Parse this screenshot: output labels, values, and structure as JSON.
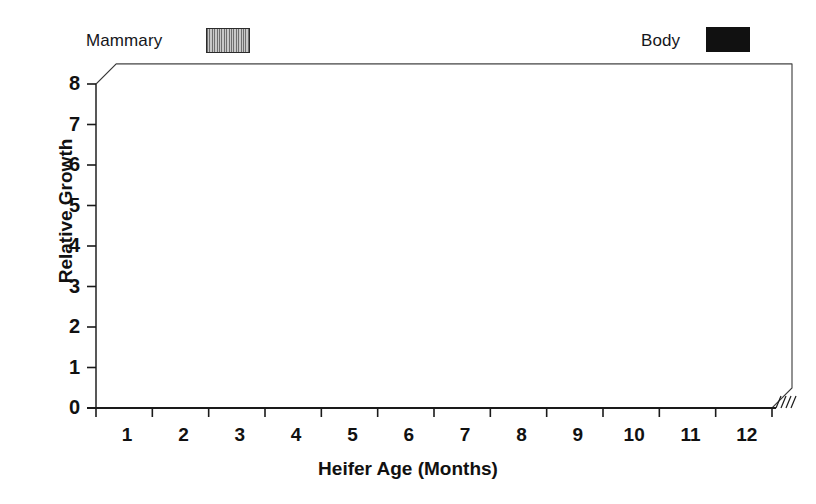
{
  "legend": {
    "items": [
      {
        "label": "Mammary",
        "swatch": "hatched-gray",
        "color": "#a8a8a8"
      },
      {
        "label": "Body",
        "swatch": "solid-black",
        "color": "#111111"
      }
    ]
  },
  "annotation": {
    "label": "Prepubertal",
    "span_months": [
      4,
      9
    ]
  },
  "chart_data": {
    "type": "bar",
    "title": "",
    "xlabel": "Heifer Age (Months)",
    "ylabel": "Relative Growth",
    "categories": [
      "1",
      "2",
      "3",
      "4",
      "5",
      "6",
      "7",
      "8",
      "9",
      "10",
      "11",
      "12"
    ],
    "ylim": [
      0,
      8
    ],
    "yticks": [
      0,
      1,
      2,
      3,
      4,
      5,
      6,
      7,
      8
    ],
    "grid": true,
    "legend_position": "top",
    "series": [
      {
        "name": "Body",
        "color": "#111111",
        "values": [
          6.0,
          6.1,
          6.2,
          6.3,
          6.4,
          6.65,
          6.7,
          7.15,
          7.35,
          7.45,
          7.6,
          7.6
        ]
      },
      {
        "name": "Mammary",
        "color": "#a8a8a8",
        "values": [
          1.0,
          1.25,
          1.35,
          1.95,
          2.3,
          2.4,
          3.55,
          4.0,
          5.0,
          5.1,
          5.2,
          5.2
        ]
      }
    ]
  }
}
